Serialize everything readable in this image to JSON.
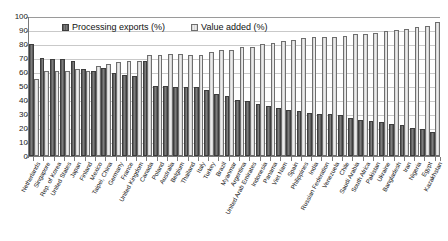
{
  "chart_data": {
    "type": "bar",
    "title": "",
    "xlabel": "",
    "ylabel": "",
    "ylim": [
      0,
      100
    ],
    "yticks": [
      0,
      10,
      20,
      30,
      40,
      50,
      60,
      70,
      80,
      90,
      100
    ],
    "grid": true,
    "legend_position": "top-center",
    "categories": [
      "Netherlands",
      "Singapore",
      "Rep. of Korea",
      "United States",
      "Japan",
      "Finland",
      "Mexico",
      "Taipei, China",
      "Germany",
      "France",
      "United Kingdom",
      "Canada",
      "Poland",
      "Australia",
      "Belgium",
      "Thailand",
      "Italy",
      "Turkey",
      "Brazil",
      "Myanmar",
      "Argentina",
      "United Arab Emirates",
      "Indonesia",
      "Panama",
      "Viet Nam",
      "Spain",
      "Philippines",
      "India",
      "Russian Federation",
      "Venezuela",
      "Chile",
      "Saudi Arabia",
      "South Africa",
      "Pakistan",
      "Ukraine",
      "Bangladesh",
      "Iran",
      "Nigeria",
      "Egypt",
      "Kazakhstan"
    ],
    "series": [
      {
        "name": "Processing exports (%)",
        "color": "#6b6b6b",
        "values": [
          80,
          70,
          69,
          69,
          68,
          62,
          61,
          63,
          59,
          58,
          57,
          68,
          50,
          50,
          49,
          49,
          49,
          47,
          44,
          43,
          40,
          39,
          37,
          36,
          34,
          33,
          32,
          31,
          30,
          30,
          29,
          27,
          26,
          25,
          24,
          23,
          22,
          20,
          19,
          17
        ]
      },
      {
        "name": "Value added (%)",
        "color": "#dcdcdc",
        "values": [
          55,
          61,
          61,
          61,
          62,
          61,
          64,
          66,
          67,
          68,
          68,
          72,
          72,
          73,
          73,
          72,
          72,
          74,
          76,
          76,
          78,
          78,
          80,
          81,
          82,
          83,
          84,
          85,
          85,
          85,
          86,
          87,
          87,
          88,
          89,
          90,
          91,
          92,
          93,
          96
        ]
      }
    ]
  },
  "legend": {
    "items": [
      {
        "label": "Processing exports (%)"
      },
      {
        "label": "Value added (%)"
      }
    ]
  }
}
